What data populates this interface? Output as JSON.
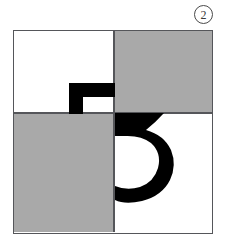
{
  "figure": {
    "index_label": "2",
    "caption": "",
    "panel": {
      "name": "four-quadrant-square",
      "quadrants": [
        {
          "position": "top-left",
          "fill": "white",
          "color": "#ffffff",
          "glyph": "gamma-inverted-L"
        },
        {
          "position": "top-right",
          "fill": "gray",
          "color": "#a9a9a9",
          "glyph": "none"
        },
        {
          "position": "bottom-left",
          "fill": "gray",
          "color": "#a9a9a9",
          "glyph": "none"
        },
        {
          "position": "bottom-right",
          "fill": "white",
          "color": "#ffffff",
          "glyph": "digit-three-curved"
        }
      ],
      "border_color": "#55565a",
      "divider_color": "#55565a",
      "glyph_color": "#000000",
      "background_color": "#ffffff"
    },
    "glyphs": [
      {
        "name": "gamma-inverted-L",
        "description": "thick black inverted-L stroke in the top-left quadrant",
        "color": "#000000"
      },
      {
        "name": "digit-three-curved",
        "description": "large thick black curved three spanning the lower-right quadrant",
        "color": "#000000"
      }
    ]
  }
}
